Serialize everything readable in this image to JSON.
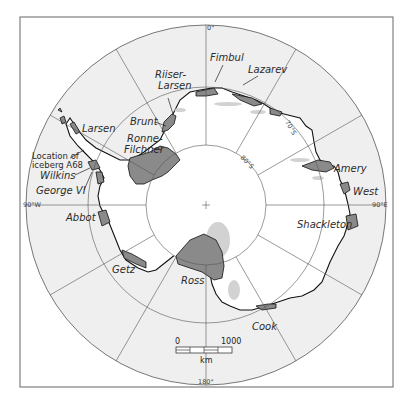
{
  "map": {
    "title": "Antarctic ice shelves",
    "colors": {
      "ocean": "#efefef",
      "land": "#ffffff",
      "ice_shelf": "#8a8a8a",
      "coast": "#111111",
      "grid": "#555555",
      "frame": "#555555"
    },
    "meridians": {
      "top": "0°",
      "bottom": "180°",
      "left": "90°W",
      "right": "90°E"
    },
    "parallels": {
      "lat70": "70°S",
      "lat80": "80°S"
    },
    "ice_shelves": [
      {
        "name": "Fimbul",
        "label": "Fimbul"
      },
      {
        "name": "Lazarev",
        "label": "Lazarev"
      },
      {
        "name": "Riiser-Larsen",
        "label_line1": "Riiser-",
        "label_line2": "Larsen"
      },
      {
        "name": "Brunt",
        "label": "Brunt"
      },
      {
        "name": "Ronne-Filchner",
        "label_line1": "Ronne-",
        "label_line2": "Filchner"
      },
      {
        "name": "Larsen",
        "label": "Larsen"
      },
      {
        "name": "Wilkins",
        "label": "Wilkins"
      },
      {
        "name": "George VI",
        "label": "George VI"
      },
      {
        "name": "Abbot",
        "label": "Abbot"
      },
      {
        "name": "Getz",
        "label": "Getz"
      },
      {
        "name": "Ross",
        "label": "Ross"
      },
      {
        "name": "Cook",
        "label": "Cook"
      },
      {
        "name": "Shackleton",
        "label": "Shackleton"
      },
      {
        "name": "West",
        "label": "West"
      },
      {
        "name": "Amery",
        "label": "Amery"
      }
    ],
    "annotation": {
      "line1": "Location of",
      "line2": "iceberg A68"
    },
    "scale_bar": {
      "start": "0",
      "end": "1000",
      "unit": "km"
    }
  }
}
